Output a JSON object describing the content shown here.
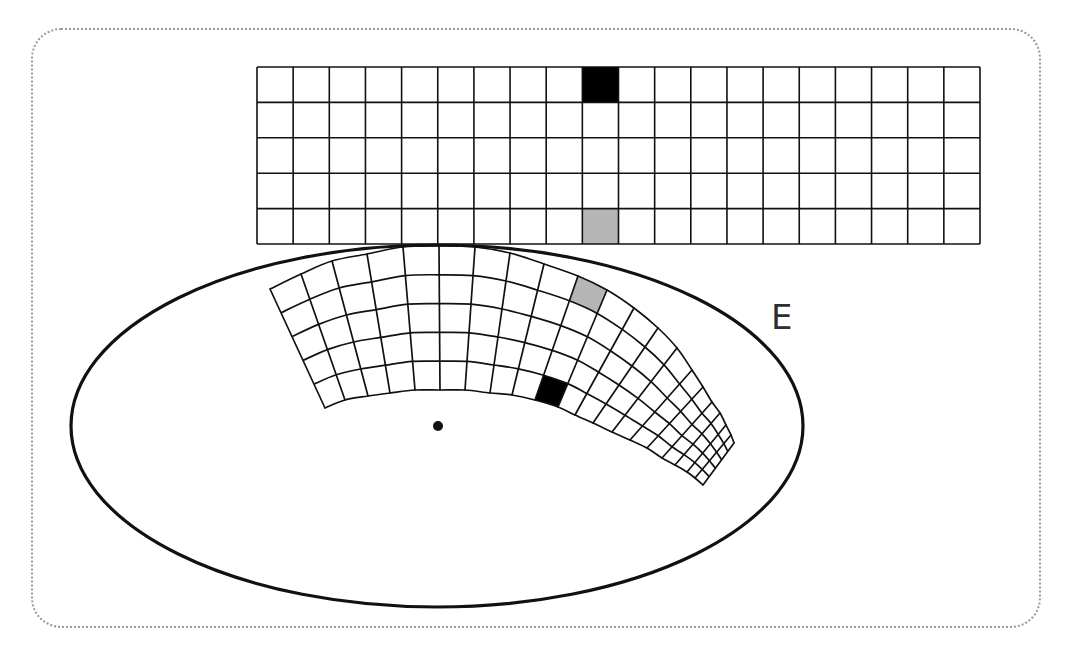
{
  "figure": {
    "label": "E",
    "colors": {
      "line": "#111111",
      "black_cell": "#000000",
      "gray_cell": "#b5b5b5",
      "frame": "#9a9a9a",
      "background": "#ffffff"
    }
  },
  "rect_grid": {
    "x": 257,
    "y": 67,
    "width": 723,
    "height": 177,
    "cols": 20,
    "rows": 5,
    "highlighted": [
      {
        "col": 9,
        "row": 0,
        "fill": "black"
      },
      {
        "col": 9,
        "row": 4,
        "fill": "gray"
      }
    ]
  },
  "ellipse": {
    "cx": 437,
    "cy": 426,
    "rx": 366,
    "ry": 181
  },
  "center_dot": {
    "x": 438,
    "y": 426,
    "r": 5
  },
  "curved_grid": {
    "cols": 20,
    "rows": 5,
    "outer_edge": [
      [
        270,
        289
      ],
      [
        301,
        274
      ],
      [
        332,
        261
      ],
      [
        367,
        254
      ],
      [
        403,
        247
      ],
      [
        439,
        246
      ],
      [
        475,
        247
      ],
      [
        510,
        253
      ],
      [
        544,
        264
      ],
      [
        578,
        276
      ],
      [
        607,
        290
      ],
      [
        634,
        308
      ],
      [
        658,
        328
      ],
      [
        677,
        348
      ],
      [
        692,
        370
      ],
      [
        703,
        387
      ],
      [
        712,
        402
      ],
      [
        720,
        413
      ],
      [
        726,
        425
      ],
      [
        731,
        435
      ],
      [
        734,
        443
      ]
    ],
    "inner_edge": [
      [
        325,
        408
      ],
      [
        345,
        400
      ],
      [
        368,
        396
      ],
      [
        390,
        393
      ],
      [
        415,
        390
      ],
      [
        440,
        390
      ],
      [
        465,
        390
      ],
      [
        490,
        393
      ],
      [
        512,
        395
      ],
      [
        535,
        400
      ],
      [
        558,
        407
      ],
      [
        575,
        415
      ],
      [
        593,
        423
      ],
      [
        612,
        432
      ],
      [
        630,
        440
      ],
      [
        647,
        448
      ],
      [
        662,
        458
      ],
      [
        675,
        465
      ],
      [
        687,
        472
      ],
      [
        695,
        478
      ],
      [
        703,
        485
      ]
    ],
    "highlighted": [
      {
        "col": 9,
        "row": 0,
        "fill": "black",
        "note": "inner row (maps from rect top row)"
      },
      {
        "col": 9,
        "row": 4,
        "fill": "gray",
        "note": "outer row (maps from rect bottom row)"
      }
    ]
  }
}
